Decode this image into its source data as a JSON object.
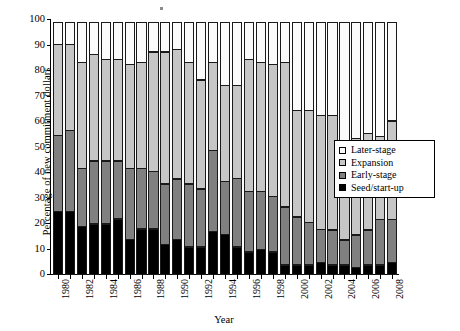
{
  "chart_data": {
    "type": "bar",
    "stacked": true,
    "title": "",
    "xlabel": "Year",
    "ylabel": "Percentage of new commitment dollars",
    "ylim": [
      0,
      100
    ],
    "ytick_step": 10,
    "yticks": [
      100,
      90,
      80,
      70,
      60,
      50,
      40,
      30,
      20,
      10,
      0
    ],
    "grid": false,
    "legend_position": "inside-right",
    "categories": [
      "1980",
      "1981",
      "1982",
      "1983",
      "1984",
      "1985",
      "1986",
      "1987",
      "1988",
      "1989",
      "1990",
      "1991",
      "1992",
      "1993",
      "1994",
      "1995",
      "1996",
      "1997",
      "1998",
      "1999",
      "2000",
      "2001",
      "2002",
      "2003",
      "2004",
      "2005",
      "2006",
      "2007",
      "2008"
    ],
    "xtick_labels": [
      "1980",
      "",
      "1982",
      "",
      "1984",
      "",
      "1986",
      "",
      "1988",
      "",
      "1990",
      "",
      "1992",
      "",
      "1994",
      "",
      "1996",
      "",
      "1998",
      "",
      "2000",
      "",
      "2002",
      "",
      "2004",
      "",
      "2006",
      "",
      "2008"
    ],
    "series": [
      {
        "name": "Seed/start-up",
        "color": "#000000",
        "values": [
          25,
          25,
          19,
          20,
          20,
          22,
          14,
          18,
          18,
          12,
          14,
          11,
          11,
          17,
          16,
          11,
          9,
          10,
          9,
          4,
          4,
          4,
          5,
          4,
          4,
          3,
          4,
          4,
          5
        ]
      },
      {
        "name": "Early-stage",
        "color": "#808080",
        "values": [
          30,
          32,
          23,
          25,
          25,
          23,
          28,
          24,
          23,
          24,
          24,
          25,
          23,
          32,
          21,
          27,
          24,
          23,
          22,
          23,
          19,
          17,
          13,
          14,
          10,
          13,
          14,
          18,
          17
        ]
      },
      {
        "name": "Expansion",
        "color": "#c6c6c6",
        "values": [
          36,
          34,
          42,
          42,
          40,
          40,
          41,
          42,
          47,
          52,
          51,
          48,
          43,
          35,
          38,
          37,
          52,
          51,
          52,
          57,
          42,
          44,
          45,
          45,
          38,
          38,
          38,
          33,
          39
        ]
      },
      {
        "name": "Later-stage",
        "color": "#fbfbfb",
        "values": [
          9,
          9,
          16,
          13,
          15,
          15,
          17,
          16,
          12,
          12,
          11,
          16,
          23,
          16,
          25,
          25,
          15,
          16,
          17,
          16,
          35,
          35,
          37,
          37,
          48,
          46,
          44,
          45,
          39
        ]
      }
    ]
  },
  "legend": {
    "items": [
      {
        "label": "Later-stage",
        "color": "#fbfbfb",
        "key": "later"
      },
      {
        "label": "Expansion",
        "color": "#c6c6c6",
        "key": "expansion"
      },
      {
        "label": "Early-stage",
        "color": "#808080",
        "key": "early"
      },
      {
        "label": "Seed/start-up",
        "color": "#000000",
        "key": "seed"
      }
    ]
  },
  "axes": {
    "x_title": "Year",
    "y_title": "Percentage of new commitment dollars"
  }
}
